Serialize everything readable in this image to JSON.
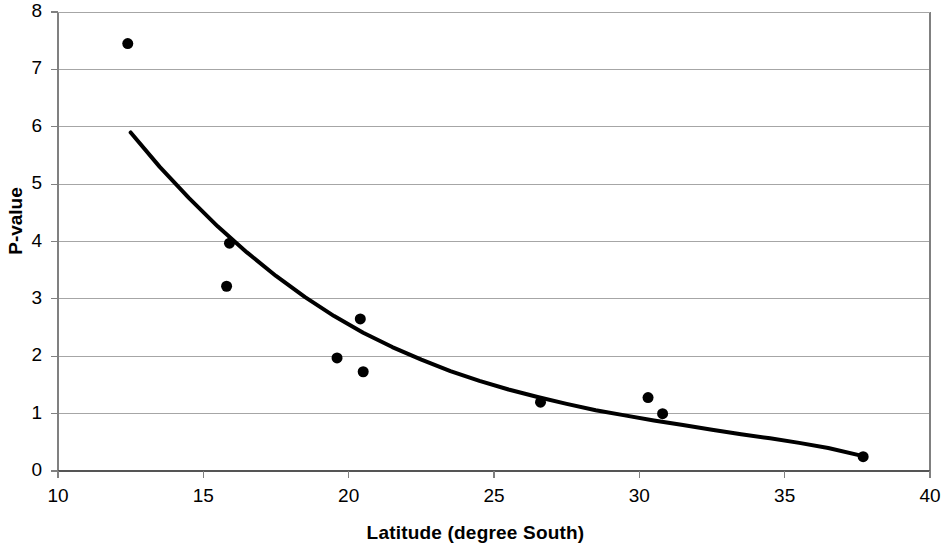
{
  "chart_data": {
    "type": "scatter",
    "title": "",
    "xlabel": "Latitude  (degree South)",
    "ylabel": "P-value",
    "xlim": [
      10,
      40
    ],
    "ylim": [
      0,
      8
    ],
    "xticks": [
      10,
      15,
      20,
      25,
      30,
      35,
      40
    ],
    "yticks": [
      0,
      1,
      2,
      3,
      4,
      5,
      6,
      7,
      8
    ],
    "xtick_labels": [
      "10",
      "15",
      "20",
      "25",
      "30",
      "35",
      "40"
    ],
    "ytick_labels": [
      "0",
      "1",
      "2",
      "3",
      "4",
      "5",
      "6",
      "7",
      "8"
    ],
    "grid": "horizontal",
    "legend": "none",
    "marker": {
      "shape": "circle",
      "color": "#000000",
      "size": 11
    },
    "points": [
      {
        "x": 12.4,
        "y": 7.45
      },
      {
        "x": 15.9,
        "y": 3.97
      },
      {
        "x": 15.8,
        "y": 3.22
      },
      {
        "x": 19.6,
        "y": 1.97
      },
      {
        "x": 20.4,
        "y": 2.65
      },
      {
        "x": 20.5,
        "y": 1.73
      },
      {
        "x": 26.6,
        "y": 1.2
      },
      {
        "x": 30.3,
        "y": 1.28
      },
      {
        "x": 30.8,
        "y": 1.0
      },
      {
        "x": 37.7,
        "y": 0.25
      }
    ],
    "series": [
      {
        "name": "fitted trend curve",
        "type": "line",
        "color": "#000000",
        "width": 4,
        "points": [
          {
            "x": 12.5,
            "y": 5.9
          },
          {
            "x": 13.5,
            "y": 5.3
          },
          {
            "x": 14.5,
            "y": 4.76
          },
          {
            "x": 15.5,
            "y": 4.26
          },
          {
            "x": 16.5,
            "y": 3.81
          },
          {
            "x": 17.5,
            "y": 3.4
          },
          {
            "x": 18.5,
            "y": 3.03
          },
          {
            "x": 19.5,
            "y": 2.7
          },
          {
            "x": 20.5,
            "y": 2.41
          },
          {
            "x": 21.5,
            "y": 2.16
          },
          {
            "x": 22.5,
            "y": 1.94
          },
          {
            "x": 23.5,
            "y": 1.74
          },
          {
            "x": 24.5,
            "y": 1.57
          },
          {
            "x": 25.5,
            "y": 1.42
          },
          {
            "x": 26.5,
            "y": 1.29
          },
          {
            "x": 27.5,
            "y": 1.17
          },
          {
            "x": 28.5,
            "y": 1.06
          },
          {
            "x": 29.5,
            "y": 0.97
          },
          {
            "x": 30.5,
            "y": 0.88
          },
          {
            "x": 31.5,
            "y": 0.8
          },
          {
            "x": 32.5,
            "y": 0.72
          },
          {
            "x": 33.5,
            "y": 0.64
          },
          {
            "x": 34.5,
            "y": 0.57
          },
          {
            "x": 35.5,
            "y": 0.49
          },
          {
            "x": 36.5,
            "y": 0.4
          },
          {
            "x": 37.7,
            "y": 0.26
          }
        ]
      }
    ],
    "colors": {
      "marker": "#000000",
      "curve": "#000000",
      "gridline": "#a6a6a6",
      "axis": "#808080",
      "background": "#ffffff"
    }
  }
}
